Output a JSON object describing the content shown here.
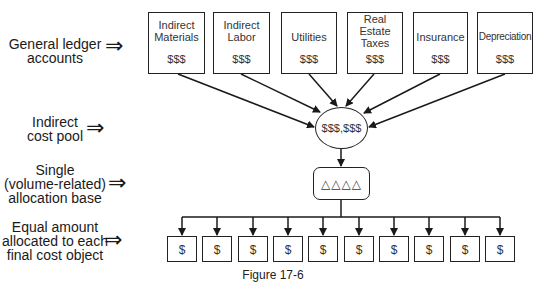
{
  "figure": {
    "caption": "Figure 17-6",
    "left_labels": [
      {
        "id": "gl",
        "lines": [
          "General ledger",
          "accounts"
        ]
      },
      {
        "id": "pool",
        "lines": [
          "Indirect",
          "cost pool"
        ]
      },
      {
        "id": "base",
        "lines": [
          "Single",
          "(volume-related)",
          "allocation base"
        ]
      },
      {
        "id": "equal",
        "lines": [
          "Equal amount",
          "allocated to each",
          "final cost object"
        ]
      }
    ],
    "pointer_glyph": "⇒",
    "accounts": [
      {
        "name_lines": [
          "Indirect",
          "Materials"
        ],
        "amount": "$$$"
      },
      {
        "name_lines": [
          "Indirect",
          "Labor"
        ],
        "amount": "$$$"
      },
      {
        "name_lines": [
          "Utilities"
        ],
        "amount": "$$$"
      },
      {
        "name_lines": [
          "Real",
          "Estate",
          "Taxes"
        ],
        "amount": "$$$"
      },
      {
        "name_lines": [
          "Insurance"
        ],
        "amount": "$$$"
      },
      {
        "name_lines": [
          "Depreciation"
        ],
        "amount": "$$$"
      }
    ],
    "cost_pool": {
      "amount": "$$$,$$$"
    },
    "allocation_base": {
      "symbol": "△△△△"
    },
    "cost_objects": [
      "$",
      "$",
      "$",
      "$",
      "$",
      "$",
      "$",
      "$",
      "$",
      "$"
    ]
  }
}
